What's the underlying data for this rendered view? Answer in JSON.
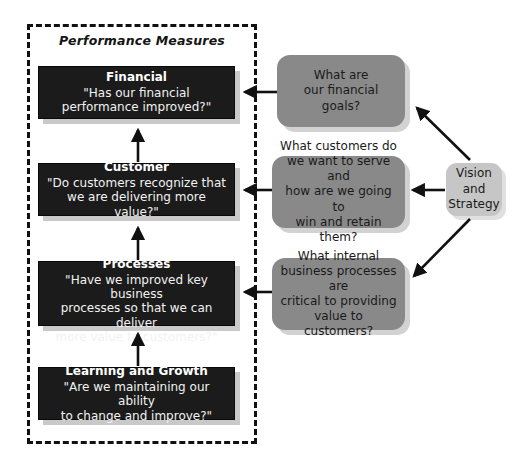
{
  "diagram": {
    "title": "Performance Measures",
    "perspectives": [
      {
        "name": "financial",
        "title": "Financial",
        "question": "\"Has our financial\nperformance improved?\""
      },
      {
        "name": "customer",
        "title": "Customer",
        "question": "\"Do customers recognize that\nwe are delivering more value?\""
      },
      {
        "name": "internal-business-processes",
        "title": "Internal Business Processes",
        "question": "\"Have we improved key business\nprocesses so that we can deliver\nmore value to customers?\""
      },
      {
        "name": "learning-and-growth",
        "title": "Learning and Growth",
        "question": "\"Are we maintaining our ability\nto change and improve?\""
      }
    ],
    "questions": [
      {
        "name": "financial-goals",
        "text": "What are\nour financial\ngoals?"
      },
      {
        "name": "customer-focus",
        "text": "What customers do\nwe want to serve and\nhow are we going to\nwin and retain them?"
      },
      {
        "name": "internal-processes",
        "text": "What internal\nbusiness processes are\ncritical to providing\nvalue to customers?"
      }
    ],
    "vision": {
      "name": "vision-and-strategy",
      "text": "Vision\nand\nStrategy"
    },
    "colors": {
      "dark_box": "#1b1b1b",
      "dark_box_shadow": "#c9c9c9",
      "gray_box": "#898989",
      "gray_box_shadow": "#d2d2d2",
      "vision_box": "#c6c6c6",
      "vision_box_shadow": "#e0e0e0",
      "arrow": "#111111",
      "frame_border": "#111111",
      "background": "#ffffff"
    }
  }
}
